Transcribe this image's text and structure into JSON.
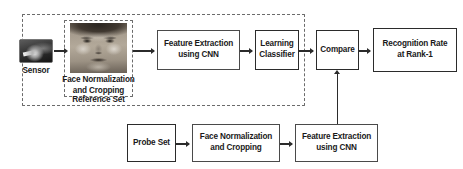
{
  "diagram": {
    "groups": {
      "reference_set_label": "Reference Set"
    },
    "reference_pipeline": {
      "sensor_label": "Sensor",
      "normalization_label_line1": "Face Normalization",
      "normalization_label_line2": "and  Cropping",
      "feature_extraction_line1": "Feature Extraction",
      "feature_extraction_line2": "using CNN",
      "classifier_line1": "Learning",
      "classifier_line2": "Classifier"
    },
    "decision": {
      "compare_label": "Compare",
      "result_line1": "Recognition Rate",
      "result_line2": "at Rank-1"
    },
    "probe_pipeline": {
      "probe_set_label": "Probe Set",
      "normalization_line1": "Face Normalization",
      "normalization_line2": "and  Cropping",
      "feature_extraction_line1": "Feature Extraction",
      "feature_extraction_line2": "using CNN"
    },
    "colors": {
      "background": "#ffffff",
      "box_border": "#4a4a4a",
      "box_border_dark": "#2b2b2b",
      "dashed_border": "#6b6b6b",
      "connector": "#2b2b2b",
      "text": "#1a1a1a"
    }
  }
}
